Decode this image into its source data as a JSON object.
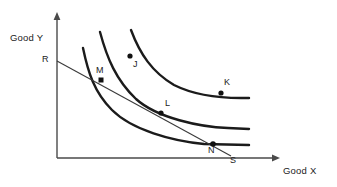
{
  "figure": {
    "width": 337,
    "height": 187,
    "background_color": "#ffffff",
    "curve_color": "#1b1b1b",
    "axis_color": "#4a4a4a",
    "budget_line_color": "#3a3a3a"
  },
  "axes": {
    "y_title": "Good Y",
    "x_title": "Good X",
    "origin": {
      "x": 57,
      "y": 158
    },
    "y_axis_top": {
      "x": 57,
      "y": 13
    },
    "x_axis_right": {
      "x": 279,
      "y": 158
    }
  },
  "budget_line": {
    "start_label": "R",
    "end_label": "S",
    "start_point": {
      "x": 57,
      "y": 61
    },
    "end_point": {
      "x": 231,
      "y": 156
    },
    "start_label_pos": {
      "x": 42,
      "y": 55
    },
    "end_label_pos": {
      "x": 230,
      "y": 156
    }
  },
  "points": [
    {
      "label": "M",
      "x": 101,
      "y": 80,
      "label_x": 96,
      "label_y": 66,
      "marker": "square",
      "on_budget_line": true
    },
    {
      "label": "J",
      "x": 130,
      "y": 56,
      "label_x": 133,
      "label_y": 60,
      "marker": "dot",
      "on_budget_line": false
    },
    {
      "label": "K",
      "x": 221,
      "y": 93,
      "label_x": 224,
      "label_y": 78,
      "marker": "dot",
      "on_budget_line": false
    },
    {
      "label": "L",
      "x": 161,
      "y": 113,
      "label_x": 165,
      "label_y": 99,
      "marker": "dot",
      "on_budget_line": true
    },
    {
      "label": "N",
      "x": 213,
      "y": 144,
      "label_x": 208,
      "label_y": 146,
      "marker": "dot",
      "on_budget_line": true
    }
  ],
  "curves": [
    {
      "name": "indifference-curve-1",
      "level": "lowest",
      "path": "M 83,48 C 88,72 94,92 112,110 C 132,130 172,141 204,144 L 249,145"
    },
    {
      "name": "indifference-curve-2",
      "level": "middle",
      "path": "M 100,32 C 107,58 116,80 136,99 C 157,118 200,127 228,128 L 249,129"
    },
    {
      "name": "indifference-curve-3",
      "level": "highest",
      "path": "M 131,30 C 140,54 152,72 174,85 C 198,97 227,98 241,98 L 249,98"
    }
  ],
  "chart_data": {
    "type": "line",
    "xlabel": "Good X",
    "ylabel": "Good Y",
    "grid": false,
    "legend": "none",
    "series": [
      {
        "name": "Indifference curve 1 (lowest utility)",
        "points_on_curve": [
          "M",
          "N"
        ]
      },
      {
        "name": "Indifference curve 2 (middle utility)",
        "points_on_curve": [
          "L"
        ]
      },
      {
        "name": "Indifference curve 3 (highest utility)",
        "points_on_curve": [
          "K"
        ]
      },
      {
        "name": "Budget line RS",
        "points_on_curve": [
          "R",
          "M",
          "L",
          "N",
          "S"
        ]
      }
    ],
    "annotations": [
      "R",
      "M",
      "J",
      "K",
      "L",
      "N",
      "S"
    ]
  }
}
